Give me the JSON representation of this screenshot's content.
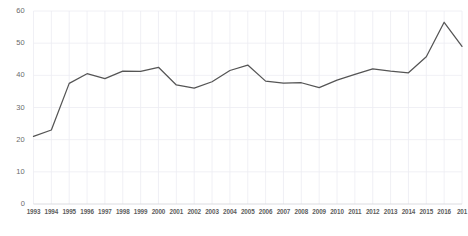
{
  "chart_data": {
    "type": "line",
    "title": "",
    "subtitle": "",
    "xlabel": "",
    "ylabel": "",
    "grid": true,
    "legend": false,
    "legend_position": "none",
    "line_color": "#555555",
    "grid_color": "#ececf2",
    "axis_label_color": "#6b6b6b",
    "background_color": "#ffffff",
    "xlim": [
      1993,
      2017
    ],
    "ylim": [
      0,
      60
    ],
    "yticks": [
      0,
      10,
      20,
      30,
      40,
      50,
      60
    ],
    "ytick_labels": [
      "0",
      "10",
      "20",
      "30",
      "40",
      "50",
      "60"
    ],
    "categories": [
      1993,
      1994,
      1995,
      1996,
      1997,
      1998,
      1999,
      2000,
      2001,
      2002,
      2003,
      2004,
      2005,
      2006,
      2007,
      2008,
      2009,
      2010,
      2011,
      2012,
      2013,
      2014,
      2015,
      2016,
      2017
    ],
    "xtick_labels": [
      "1993",
      "1994",
      "1995",
      "1996",
      "1997",
      "1998",
      "1999",
      "2000",
      "2001",
      "2002",
      "2003",
      "2004",
      "2005",
      "2006",
      "2007",
      "2008",
      "2009",
      "2010",
      "2011",
      "2012",
      "2013",
      "2014",
      "2015",
      "2016",
      "201"
    ],
    "values": [
      21.0,
      23.0,
      37.5,
      40.5,
      39.0,
      41.3,
      41.2,
      42.5,
      37.0,
      36.0,
      38.0,
      41.5,
      43.2,
      38.2,
      37.6,
      37.7,
      36.2,
      38.5,
      40.3,
      42.0,
      41.3,
      40.8,
      45.8,
      56.5,
      49.0
    ],
    "series": [
      {
        "name": "series-1",
        "color": "#555555",
        "values": [
          21.0,
          23.0,
          37.5,
          40.5,
          39.0,
          41.3,
          41.2,
          42.5,
          37.0,
          36.0,
          38.0,
          41.5,
          43.2,
          38.2,
          37.6,
          37.7,
          36.2,
          38.5,
          40.3,
          42.0,
          41.3,
          40.8,
          45.8,
          56.5,
          49.0
        ]
      }
    ]
  }
}
